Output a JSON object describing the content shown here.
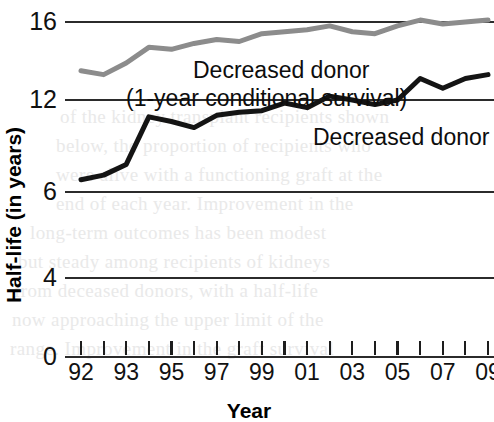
{
  "chart_data": {
    "type": "line",
    "title": "",
    "xlabel": "Year",
    "ylabel": "Half-life (in years)",
    "x": [
      1992,
      1993,
      1994,
      1995,
      1996,
      1997,
      1998,
      1999,
      2000,
      2001,
      2002,
      2003,
      2004,
      2005,
      2006,
      2007,
      2008,
      2009,
      2010
    ],
    "x_tick_labels": [
      "92",
      "",
      "93",
      "",
      "95",
      "",
      "97",
      "",
      "99",
      "",
      "01",
      "",
      "03",
      "",
      "05",
      "",
      "07",
      "",
      "09"
    ],
    "x_tick_labels_visible": [
      "92",
      "93",
      "95",
      "97",
      "99",
      "01",
      "03",
      "05",
      "07",
      "09"
    ],
    "y_tick_labels": [
      "16",
      "12",
      "6",
      "4",
      "0"
    ],
    "y_tick_values": [
      16,
      12,
      6,
      4,
      0
    ],
    "ylim": [
      0,
      16
    ],
    "grid": true,
    "grid_axis": "y",
    "legend": "inline-annotations",
    "series": [
      {
        "name": "Decreased donor (1-year conditional survival)",
        "color": "#8c8c8c",
        "annotation_line1": "Decreased donor",
        "annotation_line2": "(1-year conditional survival)",
        "values": [
          13.5,
          13.3,
          13.9,
          14.7,
          14.6,
          14.9,
          15.1,
          15.0,
          15.4,
          15.5,
          15.6,
          15.8,
          15.5,
          15.4,
          15.8,
          16.1,
          15.9,
          16.0,
          16.1
        ]
      },
      {
        "name": "Decreased donor",
        "color": "#141414",
        "annotation_line1": "Decreased donor",
        "values": [
          6.8,
          7.1,
          7.8,
          10.9,
          10.6,
          10.2,
          11.0,
          11.2,
          11.3,
          11.8,
          11.5,
          12.2,
          12.0,
          11.7,
          12.0,
          13.1,
          12.6,
          13.1,
          13.3
        ]
      }
    ],
    "annotations": {
      "gray_label_line1": "Decreased donor",
      "gray_label_line2": "(1-year conditional survival)",
      "black_label": "Decreased donor"
    }
  },
  "background_text": {
    "lines": [
      "of the kidney transplant recipients shown",
      "below, the proportion of recipients who",
      "were alive with a functioning graft at the",
      "end of each year. Improvement in the",
      "long-term outcomes has been modest",
      "but steady among recipients of kidneys",
      "from deceased donors, with a half-life",
      "now approaching the upper limit of the",
      "range. Improvement in the graft survival"
    ]
  }
}
